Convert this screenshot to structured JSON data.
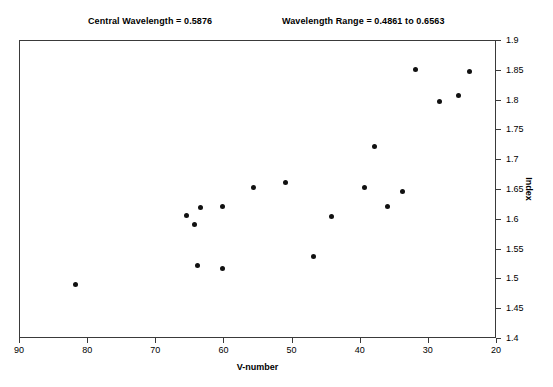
{
  "annotations": {
    "central_wavelength": "Central Wavelength = 0.5876",
    "wavelength_range": "Wavelength Range =  0.4861 to 0.6563"
  },
  "chart_data": {
    "type": "scatter",
    "title": "",
    "xlabel": "V-number",
    "ylabel": "Index",
    "xlim": [
      90,
      20
    ],
    "ylim": [
      1.4,
      1.9
    ],
    "x_reversed": true,
    "grid": false,
    "legend": null,
    "y_axis_position": "right",
    "xticks": [
      90,
      80,
      70,
      60,
      50,
      40,
      30,
      20
    ],
    "xtick_labels": [
      "90",
      "80",
      "70",
      "60",
      "50",
      "40",
      "30",
      "20"
    ],
    "yticks": [
      1.4,
      1.45,
      1.5,
      1.55,
      1.6,
      1.65,
      1.7,
      1.75,
      1.8,
      1.85,
      1.9
    ],
    "ytick_labels": [
      "1.4",
      "1.45",
      "1.5",
      "1.55",
      "1.6",
      "1.65",
      "1.7",
      "1.75",
      "1.8",
      "1.85",
      "1.9"
    ],
    "marker": "filled-circle",
    "marker_color": "#111111",
    "points": [
      {
        "x": 81.9,
        "y": 1.491
      },
      {
        "x": 65.5,
        "y": 1.607
      },
      {
        "x": 64.4,
        "y": 1.592
      },
      {
        "x": 63.5,
        "y": 1.621
      },
      {
        "x": 60.3,
        "y": 1.622
      },
      {
        "x": 64.0,
        "y": 1.524
      },
      {
        "x": 60.3,
        "y": 1.519
      },
      {
        "x": 55.7,
        "y": 1.655
      },
      {
        "x": 51.0,
        "y": 1.662
      },
      {
        "x": 47.0,
        "y": 1.538
      },
      {
        "x": 44.3,
        "y": 1.605
      },
      {
        "x": 39.4,
        "y": 1.655
      },
      {
        "x": 38.0,
        "y": 1.723
      },
      {
        "x": 36.0,
        "y": 1.622
      },
      {
        "x": 33.8,
        "y": 1.648
      },
      {
        "x": 32.0,
        "y": 1.853
      },
      {
        "x": 28.4,
        "y": 1.798
      },
      {
        "x": 25.6,
        "y": 1.808
      },
      {
        "x": 24.0,
        "y": 1.848
      }
    ]
  }
}
